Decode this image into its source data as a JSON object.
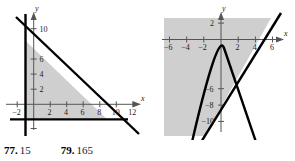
{
  "page": {
    "background": "#ffffff",
    "shade_color": "#cfcfcf",
    "line_color": "#000000",
    "axis_color": "#555555"
  },
  "figures": [
    {
      "id": "left-graph",
      "name": "triangle-region-graph",
      "type": "region-plot",
      "axis": {
        "x_label": "x",
        "y_label": "y",
        "x_ticks": [
          -2,
          2,
          4,
          6,
          8,
          10,
          12
        ],
        "x_tick_labels": [
          "−2",
          "2",
          "4",
          "6",
          "8",
          "10",
          "12"
        ],
        "y_ticks": [
          2,
          4,
          6,
          10
        ],
        "y_tick_labels": [
          "2",
          "4",
          "6",
          "10"
        ],
        "xlim": [
          -3.6,
          13.6
        ],
        "ylim": [
          -4.2,
          13.0
        ],
        "grid": false
      },
      "boundaries": [
        {
          "name": "vertical-line",
          "kind": "vertical",
          "x": -1
        },
        {
          "name": "horizontal-line",
          "kind": "horizontal",
          "y": -2
        },
        {
          "name": "diagonal-line",
          "kind": "linear",
          "slope": -1.05,
          "intercept": 7.3
        }
      ],
      "shaded_region": {
        "description": "triangle bounded left by x = -1, below by y = -2, above-right by the descending line",
        "vertices": [
          [
            -1,
            -2
          ],
          [
            -1,
            8.4
          ],
          [
            8.9,
            -2
          ]
        ]
      }
    },
    {
      "id": "right-graph",
      "name": "parabola-and-line-graph",
      "type": "region-plot",
      "axis": {
        "x_label": "x",
        "y_label": "y",
        "x_ticks": [
          -6,
          -4,
          -2,
          2,
          4,
          6
        ],
        "x_tick_labels": [
          "−6",
          "−4",
          "−2",
          "2",
          "4",
          "6"
        ],
        "y_ticks": [
          2,
          -6,
          -8,
          -10
        ],
        "y_tick_labels": [
          "2",
          "−6",
          "−8",
          "−10"
        ],
        "xlim": [
          -7.8,
          7.8
        ],
        "ylim": [
          -11.8,
          3.6
        ],
        "grid": false
      },
      "boundaries": [
        {
          "name": "diagonal-line",
          "kind": "linear",
          "slope": 2.0,
          "intercept": -8.0
        },
        {
          "name": "parabola",
          "kind": "quadratic",
          "a": -1.0,
          "h": -0.35,
          "k": -1.0
        }
      ],
      "shaded_region": {
        "description": "half-plane above and left of the line y = 2x - 8, clipped to the plot window"
      }
    }
  ],
  "answers": [
    {
      "number": "77.",
      "value": "15"
    },
    {
      "number": "79.",
      "value": "165"
    }
  ]
}
